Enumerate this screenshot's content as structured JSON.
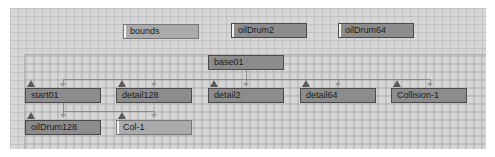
{
  "graph": {
    "floating_nodes": [
      {
        "label": "bounds"
      },
      {
        "label": "oilDrum2"
      },
      {
        "label": "oilDrum64"
      }
    ],
    "root": {
      "label": "base01"
    },
    "children": [
      {
        "label": "start01"
      },
      {
        "label": "detail128"
      },
      {
        "label": "detail2"
      },
      {
        "label": "detail64"
      },
      {
        "label": "Collision-1"
      }
    ],
    "grandchildren": [
      {
        "label": "oilDrum128"
      },
      {
        "label": "Col-1"
      }
    ]
  }
}
